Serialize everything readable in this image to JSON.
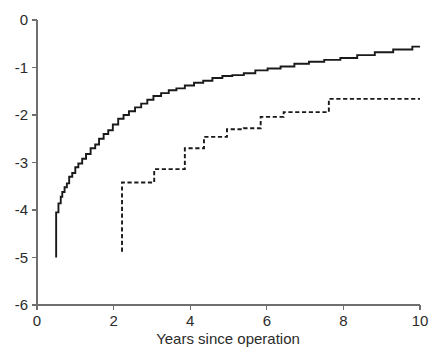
{
  "chart_data": {
    "type": "line",
    "title": "",
    "subtitle": "",
    "xlabel": "Years since operation",
    "ylabel": "",
    "xlim": [
      0,
      10
    ],
    "ylim": [
      -6,
      0
    ],
    "xticks": [
      0,
      2,
      4,
      6,
      8,
      10
    ],
    "xticklabels": [
      "0",
      "2",
      "4",
      "6",
      "8",
      "10"
    ],
    "yticks": [
      0,
      -1,
      -2,
      -3,
      -4,
      -5,
      -6
    ],
    "yticklabels": [
      "0",
      "-1",
      "-2",
      "-3",
      "-4",
      "-5",
      "-6"
    ],
    "grid": false,
    "legend": null,
    "legend_position": "none",
    "step_style": "post",
    "annotations": [],
    "series": [
      {
        "name": "solid-curve",
        "style": "solid",
        "color": "#1a1a1a",
        "x": [
          0.5,
          0.5,
          0.56,
          0.62,
          0.66,
          0.72,
          0.78,
          0.84,
          0.92,
          1.0,
          1.08,
          1.18,
          1.28,
          1.4,
          1.52,
          1.62,
          1.74,
          1.86,
          1.98,
          2.12,
          2.26,
          2.4,
          2.56,
          2.72,
          2.88,
          3.04,
          3.24,
          3.44,
          3.64,
          3.86,
          4.1,
          4.34,
          4.58,
          4.84,
          5.1,
          5.4,
          5.7,
          6.02,
          6.36,
          6.72,
          7.1,
          7.5,
          7.92,
          8.36,
          8.82,
          9.3,
          9.8,
          10.0
        ],
        "y": [
          -5.0,
          -4.05,
          -3.86,
          -3.72,
          -3.62,
          -3.52,
          -3.44,
          -3.3,
          -3.22,
          -3.1,
          -3.02,
          -2.92,
          -2.82,
          -2.7,
          -2.62,
          -2.5,
          -2.4,
          -2.32,
          -2.2,
          -2.08,
          -2.0,
          -1.92,
          -1.84,
          -1.76,
          -1.68,
          -1.6,
          -1.54,
          -1.48,
          -1.44,
          -1.38,
          -1.32,
          -1.28,
          -1.22,
          -1.18,
          -1.16,
          -1.12,
          -1.06,
          -1.02,
          -0.98,
          -0.92,
          -0.88,
          -0.84,
          -0.8,
          -0.74,
          -0.68,
          -0.62,
          -0.56,
          -0.56
        ]
      },
      {
        "name": "dashed-curve",
        "style": "dashed",
        "color": "#1a1a1a",
        "x": [
          2.22,
          2.22,
          2.36,
          2.9,
          3.06,
          3.7,
          3.86,
          4.1,
          4.36,
          4.54,
          4.96,
          5.2,
          5.4,
          5.64,
          5.84,
          6.22,
          6.44,
          7.04,
          7.38,
          7.62,
          10.0
        ],
        "y": [
          -4.88,
          -3.42,
          -3.42,
          -3.42,
          -3.14,
          -3.14,
          -2.7,
          -2.7,
          -2.46,
          -2.46,
          -2.3,
          -2.3,
          -2.28,
          -2.28,
          -2.04,
          -2.04,
          -1.94,
          -1.94,
          -1.94,
          -1.66,
          -1.66
        ]
      }
    ]
  }
}
